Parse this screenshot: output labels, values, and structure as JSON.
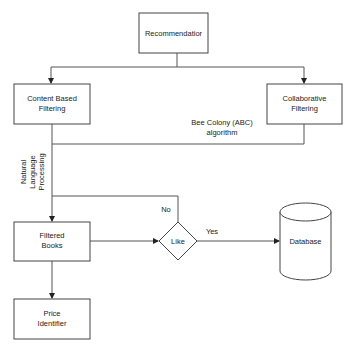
{
  "diagram": {
    "type": "flowchart",
    "nodes": {
      "recommendation": {
        "line1": "Recommendatior"
      },
      "content_based": {
        "line1": "Content Based",
        "line2": "Filtering"
      },
      "collaborative": {
        "line1": "Collaborative",
        "line2": "Filtering"
      },
      "filtered_books": {
        "line1": "Filtered",
        "line2": "Books"
      },
      "like": {
        "line1": "Like"
      },
      "database": {
        "line1": "Database"
      },
      "price_identifier": {
        "line1": "Price",
        "line2": "Identifier"
      }
    },
    "edge_labels": {
      "abc_line1": "Bee Colony (ABC)",
      "abc_line2": "algorithm",
      "nlp_line1": "Natural",
      "nlp_line2": "Language",
      "nlp_line3": "Processing",
      "no": "No",
      "yes": "Yes"
    }
  }
}
